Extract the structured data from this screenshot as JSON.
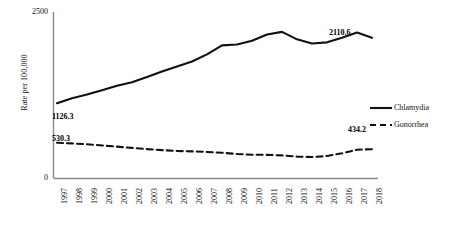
{
  "chart_data": {
    "type": "line",
    "title": "",
    "xlabel": "",
    "ylabel": "Rate per 100,000",
    "ylim": [
      0,
      2500
    ],
    "yticks": [
      0,
      2500
    ],
    "ytick_labels": [
      "0",
      "2500"
    ],
    "grid": false,
    "legend_position": "right",
    "categories": [
      "1997",
      "1998",
      "1999",
      "2000",
      "2001",
      "2002",
      "2003",
      "2004",
      "2005",
      "2006",
      "2007",
      "2008",
      "2009",
      "2010",
      "2011",
      "2012",
      "2013",
      "2014",
      "2015",
      "2016",
      "2017",
      "2018"
    ],
    "series": [
      {
        "name": "Chlamydia",
        "style": "solid",
        "color": "#111111",
        "values": [
          1126.3,
          1201.4,
          1256.2,
          1320.5,
          1390.2,
          1440.6,
          1520.8,
          1604.3,
          1677.9,
          1754.4,
          1861.2,
          1997.5,
          2010.8,
          2068.3,
          2160.6,
          2200.5,
          2088.4,
          2025.1,
          2042.6,
          2112.0,
          2190.3,
          2110.6
        ]
      },
      {
        "name": "Gonorrhea",
        "style": "dashed",
        "color": "#111111",
        "values": [
          530.3,
          520.8,
          507.4,
          490.1,
          472.6,
          453.2,
          434.7,
          420.1,
          407.5,
          400.8,
          392.4,
          380.6,
          361.2,
          350.5,
          348.9,
          340.2,
          322.6,
          315.4,
          330.8,
          372.4,
          425.6,
          434.2
        ]
      }
    ],
    "data_labels": [
      {
        "series": "Chlamydia",
        "category": "1997",
        "text": "1126.3"
      },
      {
        "series": "Chlamydia",
        "category": "2018",
        "text": "2110.6"
      },
      {
        "series": "Gonorrhea",
        "category": "1997",
        "text": "530.3"
      },
      {
        "series": "Gonorrhea",
        "category": "2018",
        "text": "434.2"
      }
    ]
  },
  "legend": {
    "items": [
      {
        "label": "Chlamydia",
        "style": "solid"
      },
      {
        "label": "Gonorrhea",
        "style": "dashed"
      }
    ]
  }
}
